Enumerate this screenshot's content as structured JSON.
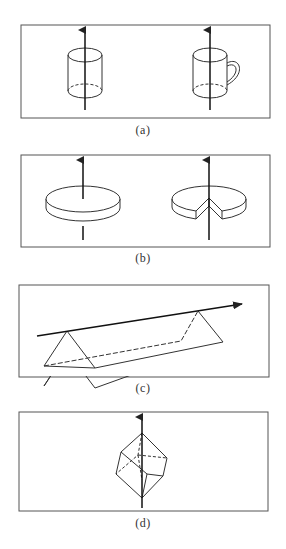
{
  "figure": {
    "panels": [
      {
        "id": "a",
        "label": "(a)",
        "objects": [
          "cylinder with vertical axis",
          "mug with vertical axis"
        ]
      },
      {
        "id": "b",
        "label": "(b)",
        "objects": [
          "solid disc with vertical axis",
          "disc with wedge cut out, vertical axis"
        ]
      },
      {
        "id": "c",
        "label": "(c)",
        "objects": [
          "triangular prism with tilted axis along its top edge"
        ]
      },
      {
        "id": "d",
        "label": "(d)",
        "objects": [
          "cube with axis through opposite corners"
        ]
      }
    ],
    "colors": {
      "stroke": "#333333",
      "border": "#555555",
      "background": "#ffffff"
    }
  }
}
